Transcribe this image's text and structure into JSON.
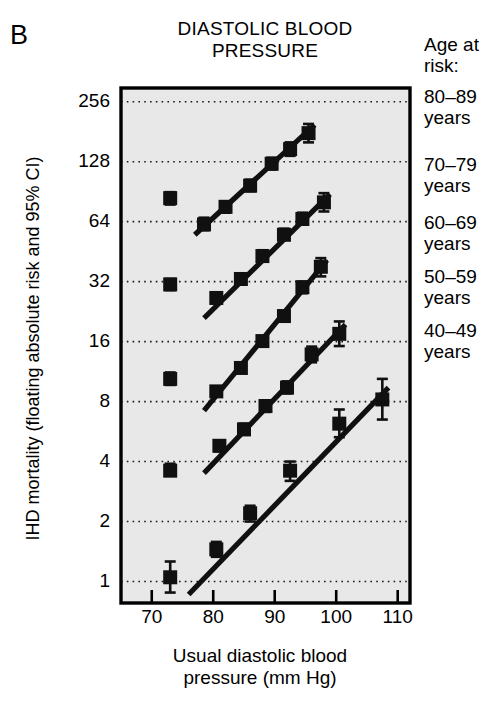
{
  "panel": {
    "letter": "B"
  },
  "title": {
    "line1": "DIASTOLIC BLOOD",
    "line2": "PRESSURE",
    "full": "DIASTOLIC BLOOD PRESSURE"
  },
  "axes": {
    "y_title": "IHD mortality (floating absolute risk and 95% CI)",
    "x_title_line1": "Usual diastolic blood",
    "x_title_line2": "pressure (mm Hg)",
    "x_title_full": "Usual diastolic blood pressure (mm Hg)"
  },
  "legend": {
    "heading_line1": "Age at",
    "heading_line2": "risk:",
    "heading_full": "Age at risk:",
    "items": [
      {
        "range": "80–89",
        "unit": "years",
        "label": "80–89 years"
      },
      {
        "range": "70–79",
        "unit": "years",
        "label": "70–79 years"
      },
      {
        "range": "60–69",
        "unit": "years",
        "label": "60–69 years"
      },
      {
        "range": "50–59",
        "unit": "years",
        "label": "50–59 years"
      },
      {
        "range": "40–49",
        "unit": "years",
        "label": "40–49 years"
      }
    ]
  },
  "chart_data": {
    "type": "scatter",
    "title": "DIASTOLIC BLOOD PRESSURE",
    "xlabel": "Usual diastolic blood pressure (mm Hg)",
    "ylabel": "IHD mortality (floating absolute risk and 95% CI)",
    "xlim": [
      65,
      112
    ],
    "ylim": [
      0.78,
      300
    ],
    "yscale": "log2",
    "xticks": [
      70,
      80,
      90,
      100,
      110
    ],
    "yticks": [
      1,
      2,
      4,
      8,
      16,
      32,
      64,
      128,
      256
    ],
    "grid": "horizontal-dotted",
    "legend_position": "right",
    "marker": "filled-square-with-95-CI-bars",
    "series": [
      {
        "name": "80–89 years",
        "points": [
          {
            "x": 73,
            "y": 84,
            "ci_low": 78,
            "ci_high": 90
          },
          {
            "x": 78.5,
            "y": 62,
            "ci_low": 58,
            "ci_high": 67
          },
          {
            "x": 82,
            "y": 76,
            "ci_low": 71,
            "ci_high": 81
          },
          {
            "x": 86,
            "y": 97,
            "ci_low": 91,
            "ci_high": 104
          },
          {
            "x": 89.5,
            "y": 125,
            "ci_low": 117,
            "ci_high": 134
          },
          {
            "x": 92.5,
            "y": 148,
            "ci_low": 137,
            "ci_high": 160
          },
          {
            "x": 95.5,
            "y": 178,
            "ci_low": 160,
            "ci_high": 198
          }
        ]
      },
      {
        "name": "70–79 years",
        "points": [
          {
            "x": 73,
            "y": 31,
            "ci_low": 29,
            "ci_high": 33
          },
          {
            "x": 80.5,
            "y": 26.5,
            "ci_low": 25,
            "ci_high": 28
          },
          {
            "x": 84.5,
            "y": 33,
            "ci_low": 31,
            "ci_high": 35
          },
          {
            "x": 88,
            "y": 43,
            "ci_low": 41,
            "ci_high": 46
          },
          {
            "x": 91.5,
            "y": 55,
            "ci_low": 52,
            "ci_high": 59
          },
          {
            "x": 94.5,
            "y": 66,
            "ci_low": 62,
            "ci_high": 71
          },
          {
            "x": 98,
            "y": 80,
            "ci_low": 72,
            "ci_high": 89
          }
        ]
      },
      {
        "name": "60–69 years",
        "points": [
          {
            "x": 73,
            "y": 10.4,
            "ci_low": 9.7,
            "ci_high": 11.2
          },
          {
            "x": 80.5,
            "y": 9.0,
            "ci_low": 8.5,
            "ci_high": 9.5
          },
          {
            "x": 84.5,
            "y": 11.8,
            "ci_low": 11.2,
            "ci_high": 12.4
          },
          {
            "x": 88,
            "y": 16.1,
            "ci_low": 15.3,
            "ci_high": 17.0
          },
          {
            "x": 91.5,
            "y": 21.5,
            "ci_low": 20.3,
            "ci_high": 22.8
          },
          {
            "x": 94.5,
            "y": 30,
            "ci_low": 28,
            "ci_high": 32
          },
          {
            "x": 97.5,
            "y": 38,
            "ci_low": 34,
            "ci_high": 42
          }
        ]
      },
      {
        "name": "50–59 years",
        "points": [
          {
            "x": 73,
            "y": 3.6,
            "ci_low": 3.4,
            "ci_high": 3.9
          },
          {
            "x": 81,
            "y": 4.8,
            "ci_low": 4.5,
            "ci_high": 5.1
          },
          {
            "x": 85,
            "y": 5.8,
            "ci_low": 5.5,
            "ci_high": 6.2
          },
          {
            "x": 88.5,
            "y": 7.6,
            "ci_low": 7.1,
            "ci_high": 8.1
          },
          {
            "x": 92,
            "y": 9.4,
            "ci_low": 8.8,
            "ci_high": 10.1
          },
          {
            "x": 96,
            "y": 13.8,
            "ci_low": 12.6,
            "ci_high": 15.1
          },
          {
            "x": 100.5,
            "y": 17.5,
            "ci_low": 15.2,
            "ci_high": 20.2
          }
        ]
      },
      {
        "name": "40–49 years",
        "points": [
          {
            "x": 73,
            "y": 1.05,
            "ci_low": 0.88,
            "ci_high": 1.26
          },
          {
            "x": 80.5,
            "y": 1.45,
            "ci_low": 1.33,
            "ci_high": 1.58
          },
          {
            "x": 86,
            "y": 2.2,
            "ci_low": 2.0,
            "ci_high": 2.4
          },
          {
            "x": 92.5,
            "y": 3.6,
            "ci_low": 3.2,
            "ci_high": 4.0
          },
          {
            "x": 100.5,
            "y": 6.2,
            "ci_low": 5.3,
            "ci_high": 7.3
          },
          {
            "x": 107.5,
            "y": 8.2,
            "ci_low": 6.5,
            "ci_high": 10.4
          }
        ]
      }
    ],
    "fit_lines": [
      {
        "name": "80–89 years",
        "x1": 77.0,
        "y1": 55.0,
        "x2": 96.5,
        "y2": 196.0
      },
      {
        "name": "70–79 years",
        "x1": 78.5,
        "y1": 21.0,
        "x2": 99.0,
        "y2": 88.0
      },
      {
        "name": "60–69 years",
        "x1": 78.5,
        "y1": 7.2,
        "x2": 98.5,
        "y2": 41.0
      },
      {
        "name": "50–59 years",
        "x1": 78.5,
        "y1": 3.5,
        "x2": 101.5,
        "y2": 19.5
      },
      {
        "name": "40–49 years",
        "x1": 76.0,
        "y1": 0.86,
        "x2": 108.5,
        "y2": 9.4
      }
    ]
  },
  "colors": {
    "plot_background": "#e8e8e8",
    "axis": "#000000",
    "marker": "#101010",
    "grid": "#1a1a1a",
    "page_background": "#ffffff"
  }
}
